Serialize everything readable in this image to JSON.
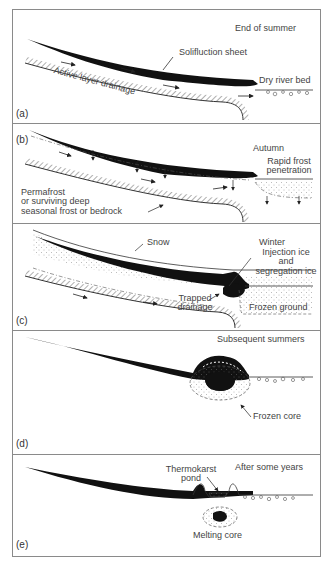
{
  "figure": {
    "panels": [
      {
        "id": "a",
        "tag": "(a)",
        "season": "End of summer",
        "labels": {
          "solifluction_sheet": "Solifluction sheet",
          "active_layer_drainage": "Active layer drainage",
          "dry_river_bed": "Dry river bed"
        }
      },
      {
        "id": "b",
        "tag": "(b)",
        "season": "Autumn",
        "labels": {
          "rapid_frost_1": "Rapid frost",
          "rapid_frost_2": "penetration",
          "permafrost_1": "Permafrost",
          "permafrost_2": "or surviving deep",
          "permafrost_3": "seasonal frost or bedrock"
        }
      },
      {
        "id": "c",
        "tag": "(c)",
        "season": "Winter",
        "labels": {
          "snow": "Snow",
          "injection_1": "Injection ice",
          "injection_2": "and",
          "injection_3": "segregation ice",
          "trapped_1": "Trapped",
          "trapped_2": "drainage",
          "frozen_ground": "Frozen ground"
        }
      },
      {
        "id": "d",
        "tag": "(d)",
        "season": "Subsequent summers",
        "labels": {
          "frozen_core": "Frozen core"
        }
      },
      {
        "id": "e",
        "tag": "(e)",
        "season": "After some years",
        "labels": {
          "thermokarst_1": "Thermokarst",
          "thermokarst_2": "pond",
          "melting_core": "Melting core"
        }
      }
    ],
    "colors": {
      "ink": "#111111",
      "frame": "#8a8a8a",
      "text": "#444444"
    }
  }
}
